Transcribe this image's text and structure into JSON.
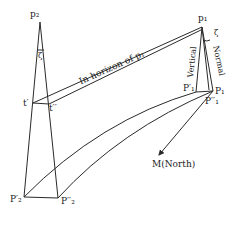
{
  "diagram": {
    "labels": {
      "p2": "p₂",
      "p1_top": "p₁",
      "zeta_left": "ζ",
      "zeta_right": "ζ",
      "t_prime": "t′",
      "t_double_prime": "t′′",
      "horizon_text": "In horizon of p₁",
      "vertical_text": "Vertical",
      "normal_text": "Normal",
      "P1_prime": "P′₁",
      "P1": "P₁",
      "P1_double_prime": "P′′₁",
      "north": "M(North)",
      "P2_prime": "P′₂",
      "P2_double_prime": "P′′₂"
    },
    "colors": {
      "line": "#2a2a2a",
      "text": "#222222",
      "background": "#ffffff"
    }
  }
}
